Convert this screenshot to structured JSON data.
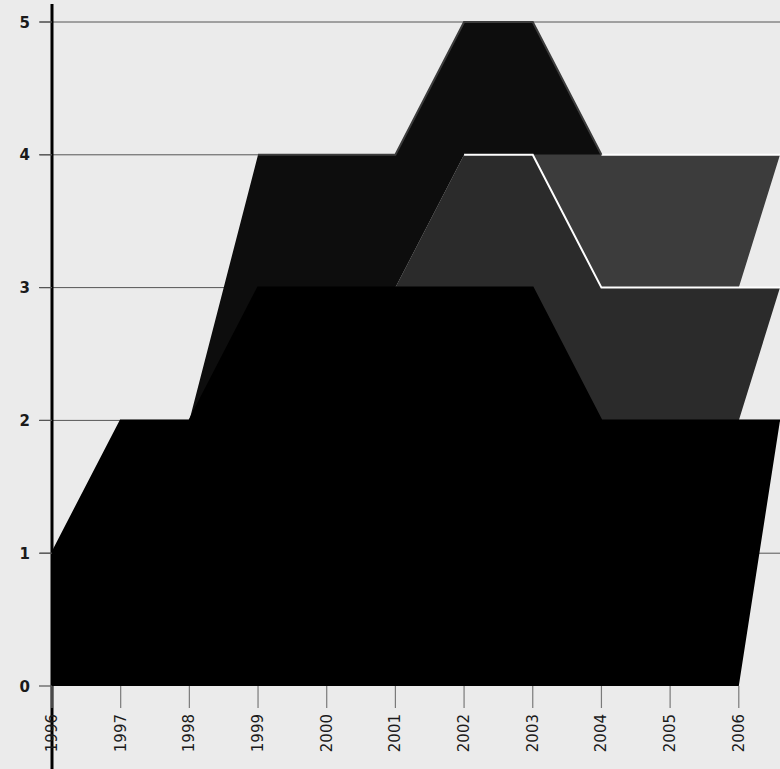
{
  "chart_data": {
    "type": "area",
    "stacked": true,
    "title": "",
    "subtitle": "",
    "xlabel": "",
    "ylabel": "",
    "categories": [
      "1996",
      "1997",
      "1998",
      "1999",
      "2000",
      "2001",
      "2002",
      "2003",
      "2004",
      "2005",
      "2006"
    ],
    "x": [
      1996,
      1997,
      1998,
      1999,
      2000,
      2001,
      2002,
      2003,
      2004,
      2005,
      2006
    ],
    "xlim": [
      1996,
      2006.6
    ],
    "ylim": [
      0,
      5.15
    ],
    "yticks": [
      0,
      1,
      2,
      3,
      4,
      5
    ],
    "ytick_labels": [
      "0",
      "1",
      "2",
      "3",
      "4",
      "5"
    ],
    "grid": true,
    "grid_axis": "y",
    "legend": "none",
    "interpolation": "linear",
    "series": [
      {
        "name": "series-1",
        "color": "#000000",
        "edge_color": "#000000",
        "values": [
          1,
          2,
          2,
          3,
          3,
          3,
          3,
          3,
          2,
          2,
          2
        ]
      },
      {
        "name": "series-2",
        "color": "#2b2b2b",
        "edge_color": "#ffffff",
        "values": [
          0,
          0,
          0,
          0,
          0,
          0,
          1,
          1,
          1,
          1,
          1
        ]
      },
      {
        "name": "series-3",
        "color": "#3c3c3c",
        "edge_color": "#ffffff",
        "values": [
          0,
          0,
          0,
          0,
          0,
          0,
          0,
          0,
          1,
          1,
          1
        ]
      },
      {
        "name": "series-4",
        "color": "#0d0d0d",
        "edge_color": "#3c3c3c",
        "values": [
          0,
          0,
          0,
          1,
          1,
          1,
          1,
          1,
          0,
          0,
          0
        ]
      }
    ],
    "stack_totals": [
      1,
      2,
      2,
      4,
      4,
      4,
      5,
      5,
      4,
      4,
      4
    ],
    "background_color": "#ebebeb",
    "plot_background_color": "#ebebeb",
    "axis_color": "#000000",
    "gridline_color": "#555555",
    "tick_label_color": "#1a1a1a",
    "xtick_rotation": 90
  },
  "axes": {
    "y_ticks": [
      {
        "label": "5",
        "value": 5
      },
      {
        "label": "4",
        "value": 4
      },
      {
        "label": "3",
        "value": 3
      },
      {
        "label": "2",
        "value": 2
      },
      {
        "label": "1",
        "value": 1
      },
      {
        "label": "0",
        "value": 0
      }
    ],
    "x_ticks": [
      {
        "label": "1996",
        "value": 1996
      },
      {
        "label": "1997",
        "value": 1997
      },
      {
        "label": "1998",
        "value": 1998
      },
      {
        "label": "1999",
        "value": 1999
      },
      {
        "label": "2000",
        "value": 2000
      },
      {
        "label": "2001",
        "value": 2001
      },
      {
        "label": "2002",
        "value": 2002
      },
      {
        "label": "2003",
        "value": 2003
      },
      {
        "label": "2004",
        "value": 2004
      },
      {
        "label": "2005",
        "value": 2005
      },
      {
        "label": "2006",
        "value": 2006
      }
    ]
  }
}
